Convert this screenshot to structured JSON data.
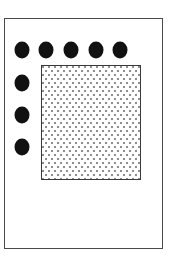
{
  "diagram": {
    "outer_frame": {
      "x": 4,
      "y": 18,
      "width": 159,
      "height": 231,
      "stroke": "#4a4a4a"
    },
    "dots": [
      {
        "cx": 22,
        "cy": 50
      },
      {
        "cx": 46,
        "cy": 50
      },
      {
        "cx": 71,
        "cy": 50
      },
      {
        "cx": 96,
        "cy": 50
      },
      {
        "cx": 120,
        "cy": 50
      },
      {
        "cx": 22,
        "cy": 83
      },
      {
        "cx": 22,
        "cy": 115
      },
      {
        "cx": 22,
        "cy": 147
      }
    ],
    "dot_color": "#111111",
    "inner_area": {
      "x": 41,
      "y": 65,
      "width": 100,
      "height": 115,
      "fill": "stippled",
      "stroke": "#3a3a3a"
    }
  }
}
